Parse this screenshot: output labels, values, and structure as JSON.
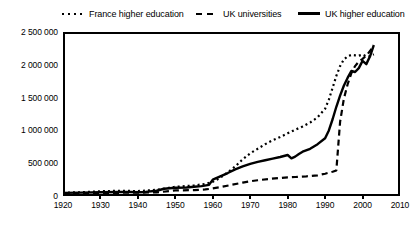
{
  "chart_data": {
    "type": "line",
    "title": "",
    "xlabel": "",
    "ylabel": "",
    "xlim": [
      1920,
      2010
    ],
    "ylim": [
      0,
      2500000
    ],
    "grid": false,
    "legend_position": "top",
    "x_ticks": [
      1920,
      1930,
      1940,
      1950,
      1960,
      1970,
      1980,
      1990,
      2000,
      2010
    ],
    "x_tick_labels": [
      "1920",
      "1930",
      "1940",
      "1950",
      "1960",
      "1970",
      "1980",
      "1990",
      "2000",
      "2010"
    ],
    "y_ticks": [
      0,
      500000,
      1000000,
      1500000,
      2000000,
      2500000
    ],
    "y_tick_labels": [
      "0",
      "500 000",
      "1 000 000",
      "1 500 000",
      "2 000 000",
      "2 500 000"
    ],
    "series": [
      {
        "name": "France higher education",
        "style": "dotted",
        "color": "#000000",
        "points": [
          [
            1920,
            50000
          ],
          [
            1925,
            58000
          ],
          [
            1930,
            72000
          ],
          [
            1935,
            80000
          ],
          [
            1940,
            75000
          ],
          [
            1945,
            95000
          ],
          [
            1950,
            140000
          ],
          [
            1955,
            160000
          ],
          [
            1958,
            185000
          ],
          [
            1960,
            215000
          ],
          [
            1962,
            280000
          ],
          [
            1964,
            360000
          ],
          [
            1966,
            450000
          ],
          [
            1968,
            560000
          ],
          [
            1970,
            650000
          ],
          [
            1972,
            720000
          ],
          [
            1974,
            790000
          ],
          [
            1976,
            850000
          ],
          [
            1978,
            900000
          ],
          [
            1980,
            955000
          ],
          [
            1982,
            1010000
          ],
          [
            1984,
            1060000
          ],
          [
            1986,
            1120000
          ],
          [
            1988,
            1200000
          ],
          [
            1990,
            1330000
          ],
          [
            1991,
            1470000
          ],
          [
            1992,
            1650000
          ],
          [
            1993,
            1830000
          ],
          [
            1994,
            1980000
          ],
          [
            1995,
            2080000
          ],
          [
            1996,
            2130000
          ],
          [
            1997,
            2150000
          ],
          [
            1998,
            2145000
          ],
          [
            1999,
            2140000
          ],
          [
            2000,
            2155000
          ],
          [
            2001,
            2130000
          ],
          [
            2002,
            2130000
          ],
          [
            2003,
            2160000
          ]
        ]
      },
      {
        "name": "UK universities",
        "style": "dashed",
        "color": "#000000",
        "points": [
          [
            1920,
            40000
          ],
          [
            1930,
            48000
          ],
          [
            1940,
            50000
          ],
          [
            1945,
            55000
          ],
          [
            1950,
            85000
          ],
          [
            1955,
            90000
          ],
          [
            1958,
            100000
          ],
          [
            1960,
            115000
          ],
          [
            1962,
            135000
          ],
          [
            1965,
            170000
          ],
          [
            1968,
            205000
          ],
          [
            1970,
            225000
          ],
          [
            1972,
            240000
          ],
          [
            1975,
            260000
          ],
          [
            1978,
            275000
          ],
          [
            1980,
            285000
          ],
          [
            1982,
            290000
          ],
          [
            1985,
            300000
          ],
          [
            1988,
            315000
          ],
          [
            1990,
            340000
          ],
          [
            1991,
            355000
          ],
          [
            1992,
            370000
          ],
          [
            1993,
            390000
          ],
          [
            1994,
            1130000
          ],
          [
            1995,
            1480000
          ],
          [
            1996,
            1700000
          ],
          [
            1997,
            1870000
          ],
          [
            1998,
            1980000
          ],
          [
            1999,
            2050000
          ],
          [
            2000,
            2090000
          ],
          [
            2001,
            2140000
          ],
          [
            2002,
            2210000
          ],
          [
            2003,
            2300000
          ]
        ]
      },
      {
        "name": "UK higher education",
        "style": "solid",
        "color": "#000000",
        "points": [
          [
            1920,
            48000
          ],
          [
            1925,
            52000
          ],
          [
            1930,
            58000
          ],
          [
            1935,
            62000
          ],
          [
            1938,
            60000
          ],
          [
            1940,
            58000
          ],
          [
            1942,
            62000
          ],
          [
            1945,
            80000
          ],
          [
            1947,
            110000
          ],
          [
            1950,
            125000
          ],
          [
            1953,
            130000
          ],
          [
            1955,
            140000
          ],
          [
            1957,
            150000
          ],
          [
            1959,
            170000
          ],
          [
            1960,
            250000
          ],
          [
            1962,
            300000
          ],
          [
            1964,
            350000
          ],
          [
            1966,
            405000
          ],
          [
            1968,
            450000
          ],
          [
            1970,
            490000
          ],
          [
            1972,
            520000
          ],
          [
            1974,
            545000
          ],
          [
            1976,
            570000
          ],
          [
            1978,
            595000
          ],
          [
            1980,
            625000
          ],
          [
            1981,
            575000
          ],
          [
            1982,
            600000
          ],
          [
            1983,
            640000
          ],
          [
            1984,
            675000
          ],
          [
            1986,
            720000
          ],
          [
            1988,
            790000
          ],
          [
            1990,
            880000
          ],
          [
            1991,
            1000000
          ],
          [
            1992,
            1170000
          ],
          [
            1993,
            1360000
          ],
          [
            1994,
            1530000
          ],
          [
            1995,
            1680000
          ],
          [
            1996,
            1800000
          ],
          [
            1997,
            1905000
          ],
          [
            1998,
            1890000
          ],
          [
            1999,
            1950000
          ],
          [
            2000,
            2060000
          ],
          [
            2001,
            2010000
          ],
          [
            2002,
            2130000
          ],
          [
            2003,
            2300000
          ]
        ]
      }
    ],
    "legend": [
      {
        "label": "France higher education",
        "style": "dotted"
      },
      {
        "label": "UK universities",
        "style": "dashed"
      },
      {
        "label": "UK higher education",
        "style": "solid"
      }
    ]
  }
}
